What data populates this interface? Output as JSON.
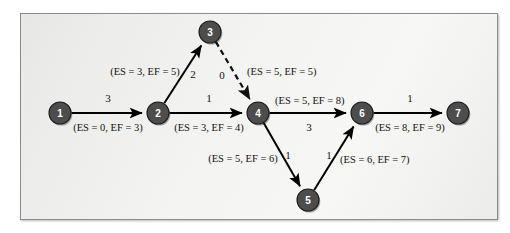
{
  "figure": {
    "kind": "activity-on-node-network-diagram",
    "background_color": "#f4f4f2",
    "frame_border_color": "#8c8c8c",
    "node_fill_color": "#4d4d4d",
    "node_text_color": "#ffffff",
    "edge_color": "#000000"
  },
  "nodes": [
    {
      "id": "1",
      "label": "1",
      "x": 60,
      "y": 113,
      "r": 11
    },
    {
      "id": "2",
      "label": "2",
      "x": 158,
      "y": 113,
      "r": 11
    },
    {
      "id": "3",
      "label": "3",
      "x": 210,
      "y": 32,
      "r": 11
    },
    {
      "id": "4",
      "label": "4",
      "x": 258,
      "y": 113,
      "r": 11
    },
    {
      "id": "5",
      "label": "5",
      "x": 308,
      "y": 200,
      "r": 11
    },
    {
      "id": "6",
      "label": "6",
      "x": 362,
      "y": 113,
      "r": 11
    },
    {
      "id": "7",
      "label": "7",
      "x": 458,
      "y": 113,
      "r": 11
    }
  ],
  "edges": [
    {
      "id": "e1",
      "from": "1",
      "to": "2",
      "duration": "3",
      "style": "solid",
      "duration_label_x": 108,
      "duration_label_y": 98,
      "time_label": "(ES = 0, EF = 3)",
      "time_label_x": 108,
      "time_label_y": 127,
      "time_anchor": "middle"
    },
    {
      "id": "e2",
      "from": "2",
      "to": "3",
      "duration": "2",
      "style": "solid",
      "duration_label_x": 193,
      "duration_label_y": 74,
      "time_label": "(ES = 3, EF = 5)",
      "time_label_x": 145,
      "time_label_y": 71,
      "time_anchor": "middle"
    },
    {
      "id": "e3",
      "from": "2",
      "to": "4",
      "duration": "1",
      "style": "solid",
      "duration_label_x": 209,
      "duration_label_y": 98,
      "time_label": "(ES = 3, EF = 4)",
      "time_label_x": 209,
      "time_label_y": 127,
      "time_anchor": "middle"
    },
    {
      "id": "e4",
      "from": "3",
      "to": "4",
      "duration": "0",
      "style": "dashed",
      "duration_label_x": 222,
      "duration_label_y": 75,
      "time_label": "(ES = 5, EF = 5)",
      "time_label_x": 247,
      "time_label_y": 71,
      "time_anchor": "start"
    },
    {
      "id": "e5",
      "from": "4",
      "to": "6",
      "duration": "3",
      "style": "solid",
      "duration_label_x": 309,
      "duration_label_y": 127,
      "time_label": "(ES = 5, EF = 8)",
      "time_label_x": 275,
      "time_label_y": 100,
      "time_anchor": "start"
    },
    {
      "id": "e6",
      "from": "4",
      "to": "5",
      "duration": "1",
      "style": "solid",
      "duration_label_x": 288,
      "duration_label_y": 155,
      "time_label": "(ES = 5, EF = 6)",
      "time_label_x": 243,
      "time_label_y": 158,
      "time_anchor": "middle"
    },
    {
      "id": "e7",
      "from": "5",
      "to": "6",
      "duration": "1",
      "style": "solid",
      "duration_label_x": 329,
      "duration_label_y": 155,
      "time_label": "(ES = 6, EF = 7)",
      "time_label_x": 340,
      "time_label_y": 159,
      "time_anchor": "start"
    },
    {
      "id": "e8",
      "from": "6",
      "to": "7",
      "duration": "1",
      "style": "solid",
      "duration_label_x": 410,
      "duration_label_y": 98,
      "time_label": "(ES = 8, EF = 9)",
      "time_label_x": 410,
      "time_label_y": 127,
      "time_anchor": "middle"
    }
  ],
  "chart_data": {
    "type": "diagram",
    "title": "",
    "nodes": [
      "1",
      "2",
      "3",
      "4",
      "5",
      "6",
      "7"
    ],
    "links": [
      {
        "from": "1",
        "to": "2",
        "duration": 3,
        "ES": 0,
        "EF": 3,
        "dummy": false
      },
      {
        "from": "2",
        "to": "3",
        "duration": 2,
        "ES": 3,
        "EF": 5,
        "dummy": false
      },
      {
        "from": "2",
        "to": "4",
        "duration": 1,
        "ES": 3,
        "EF": 4,
        "dummy": false
      },
      {
        "from": "3",
        "to": "4",
        "duration": 0,
        "ES": 5,
        "EF": 5,
        "dummy": true
      },
      {
        "from": "4",
        "to": "6",
        "duration": 3,
        "ES": 5,
        "EF": 8,
        "dummy": false
      },
      {
        "from": "4",
        "to": "5",
        "duration": 1,
        "ES": 5,
        "EF": 6,
        "dummy": false
      },
      {
        "from": "5",
        "to": "6",
        "duration": 1,
        "ES": 6,
        "EF": 7,
        "dummy": false
      },
      {
        "from": "6",
        "to": "7",
        "duration": 1,
        "ES": 8,
        "EF": 9,
        "dummy": false
      }
    ]
  }
}
